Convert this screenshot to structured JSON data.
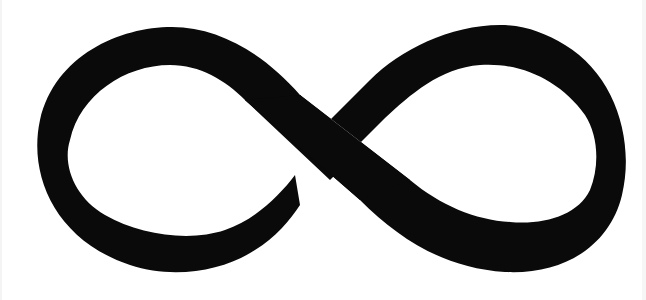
{
  "image": {
    "subject": "infinity-symbol",
    "background_color": "#ffffff",
    "symbol_color": "#0a0a0a"
  }
}
